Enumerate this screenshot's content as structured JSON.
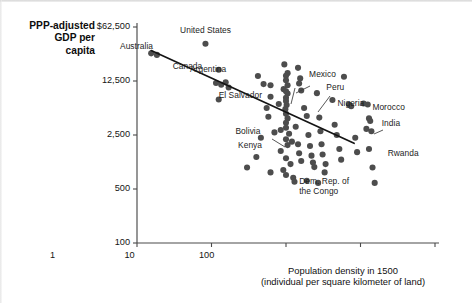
{
  "chart_data": {
    "type": "scatter",
    "title": "",
    "ylabel": "PPP-adjusted GDP per capita",
    "ylabel_lines": [
      "PPP-adjusted",
      "GDP per",
      "capita"
    ],
    "xlabel": "Population density in 1500",
    "xlabel_sub": "(individual per square kilometer of land)",
    "xlabel_lines": [
      "Population density in 1500",
      "(individual per square kilometer of land)"
    ],
    "xscale": "log",
    "yscale": "log",
    "xlim": [
      0.01,
      100
    ],
    "ylim": [
      100,
      62500
    ],
    "grid": false,
    "legend": null,
    "xticks": [
      {
        "value": 0.01,
        "label": "0.01"
      },
      {
        "value": 0.1,
        "label": "0.1"
      },
      {
        "value": 1,
        "label": "1"
      },
      {
        "value": 10,
        "label": "10"
      },
      {
        "value": 100,
        "label": "100"
      }
    ],
    "yticks": [
      {
        "value": 62500,
        "label": "$62,500"
      },
      {
        "value": 12500,
        "label": "12,500"
      },
      {
        "value": 2500,
        "label": "2,500"
      },
      {
        "value": 500,
        "label": "500"
      },
      {
        "value": 100,
        "label": "100"
      }
    ],
    "trendline": {
      "x": [
        0.0155,
        8.2
      ],
      "y": [
        31000,
        1950
      ],
      "description": "downward-sloping fitted regression line"
    },
    "annotations": [
      {
        "text": "Australia",
        "x": 0.018,
        "y": 26000
      },
      {
        "text": "Canada",
        "x": 0.025,
        "y": 21000
      },
      {
        "text": "United States",
        "x": 0.09,
        "y": 43000
      },
      {
        "text": "Argentina",
        "x": 0.13,
        "y": 14500
      },
      {
        "text": "Mexico",
        "x": 1.5,
        "y": 13000
      },
      {
        "text": "El Salvador",
        "x": 0.75,
        "y": 8200
      },
      {
        "text": "Peru",
        "x": 2.4,
        "y": 9200
      },
      {
        "text": "Nigeria",
        "x": 3.6,
        "y": 6400
      },
      {
        "text": "Morocco",
        "x": 12.0,
        "y": 6100
      },
      {
        "text": "Bolivia",
        "x": 0.6,
        "y": 3400
      },
      {
        "text": "India",
        "x": 16.0,
        "y": 3900
      },
      {
        "text": "Kenya",
        "x": 0.65,
        "y": 2300
      },
      {
        "text": "Rwanda",
        "x": 17.0,
        "y": 1650
      },
      {
        "text": "Dem. Rep. of the Congo",
        "x": 1.6,
        "y": 760,
        "lines": [
          "Dem. Rep. of",
          "the Congo"
        ]
      }
    ],
    "points": [
      {
        "x": 0.0155,
        "y": 28500,
        "label": "Australia"
      },
      {
        "x": 0.0185,
        "y": 27200,
        "label": "Canada"
      },
      {
        "x": 0.083,
        "y": 38000,
        "label": "United States"
      },
      {
        "x": 0.125,
        "y": 17500
      },
      {
        "x": 0.115,
        "y": 11800
      },
      {
        "x": 0.135,
        "y": 11200
      },
      {
        "x": 0.155,
        "y": 12000
      },
      {
        "x": 0.17,
        "y": 10300
      },
      {
        "x": 0.125,
        "y": 7200
      },
      {
        "x": 0.42,
        "y": 14500
      },
      {
        "x": 0.5,
        "y": 11400
      },
      {
        "x": 0.62,
        "y": 11000
      },
      {
        "x": 0.55,
        "y": 5600
      },
      {
        "x": 0.58,
        "y": 4300
      },
      {
        "x": 0.7,
        "y": 2700
      },
      {
        "x": 0.46,
        "y": 2300
      },
      {
        "x": 0.4,
        "y": 1300
      },
      {
        "x": 0.3,
        "y": 950
      },
      {
        "x": 0.62,
        "y": 820
      },
      {
        "x": 0.95,
        "y": 20500
      },
      {
        "x": 1.05,
        "y": 15800
      },
      {
        "x": 1.0,
        "y": 14600
      },
      {
        "x": 1.0,
        "y": 12800
      },
      {
        "x": 1.05,
        "y": 11000
      },
      {
        "x": 0.93,
        "y": 9800
      },
      {
        "x": 1.0,
        "y": 9200
      },
      {
        "x": 1.05,
        "y": 8600
      },
      {
        "x": 1.0,
        "y": 7600
      },
      {
        "x": 1.0,
        "y": 6900
      },
      {
        "x": 1.02,
        "y": 6100
      },
      {
        "x": 0.98,
        "y": 5400
      },
      {
        "x": 1.0,
        "y": 4700
      },
      {
        "x": 1.05,
        "y": 4100
      },
      {
        "x": 1.0,
        "y": 3600
      },
      {
        "x": 1.0,
        "y": 3100
      },
      {
        "x": 1.1,
        "y": 2600
      },
      {
        "x": 1.0,
        "y": 2200
      },
      {
        "x": 1.05,
        "y": 1850
      },
      {
        "x": 0.85,
        "y": 1550
      },
      {
        "x": 1.0,
        "y": 1250
      },
      {
        "x": 1.15,
        "y": 1050
      },
      {
        "x": 0.92,
        "y": 880
      },
      {
        "x": 1.0,
        "y": 760
      },
      {
        "x": 1.25,
        "y": 700
      },
      {
        "x": 1.45,
        "y": 18500
      },
      {
        "x": 1.55,
        "y": 13500
      },
      {
        "x": 1.5,
        "y": 11600
      },
      {
        "x": 1.6,
        "y": 9400
      },
      {
        "x": 1.45,
        "y": 1900
      },
      {
        "x": 1.5,
        "y": 1450
      },
      {
        "x": 1.6,
        "y": 1150
      },
      {
        "x": 1.75,
        "y": 5600
      },
      {
        "x": 1.9,
        "y": 4400
      },
      {
        "x": 2.0,
        "y": 2500
      },
      {
        "x": 2.1,
        "y": 1800
      },
      {
        "x": 2.2,
        "y": 1350
      },
      {
        "x": 2.3,
        "y": 1100
      },
      {
        "x": 2.4,
        "y": 960
      },
      {
        "x": 2.6,
        "y": 8700
      },
      {
        "x": 2.8,
        "y": 4200
      },
      {
        "x": 2.9,
        "y": 2800
      },
      {
        "x": 3.0,
        "y": 1900
      },
      {
        "x": 3.1,
        "y": 1400
      },
      {
        "x": 3.4,
        "y": 1050
      },
      {
        "x": 3.3,
        "y": 820
      },
      {
        "x": 4.2,
        "y": 7100
      },
      {
        "x": 4.5,
        "y": 3400
      },
      {
        "x": 4.8,
        "y": 2500
      },
      {
        "x": 5.2,
        "y": 1650
      },
      {
        "x": 5.5,
        "y": 1200
      },
      {
        "x": 6.0,
        "y": 14200
      },
      {
        "x": 7.0,
        "y": 6200
      },
      {
        "x": 7.5,
        "y": 5900
      },
      {
        "x": 8.5,
        "y": 2300
      },
      {
        "x": 9.0,
        "y": 1500
      },
      {
        "x": 11.0,
        "y": 6400
      },
      {
        "x": 12.5,
        "y": 6200
      },
      {
        "x": 13.0,
        "y": 4100
      },
      {
        "x": 13.5,
        "y": 3800
      },
      {
        "x": 12.0,
        "y": 3000
      },
      {
        "x": 14.0,
        "y": 2800
      },
      {
        "x": 13.0,
        "y": 1650,
        "label": "Rwanda"
      },
      {
        "x": 14.5,
        "y": 950
      },
      {
        "x": 15.5,
        "y": 600
      },
      {
        "x": 0.62,
        "y": 7800
      },
      {
        "x": 0.8,
        "y": 6300
      },
      {
        "x": 1.3,
        "y": 620
      },
      {
        "x": 1.9,
        "y": 640
      },
      {
        "x": 2.7,
        "y": 600
      },
      {
        "x": 0.85,
        "y": 2900
      },
      {
        "x": 1.35,
        "y": 3200
      },
      {
        "x": 1.2,
        "y": 2050
      }
    ]
  },
  "plot_area": {
    "x_left_px": 137,
    "x_right_px": 435,
    "y_top_px": 27,
    "y_bottom_px": 243
  }
}
